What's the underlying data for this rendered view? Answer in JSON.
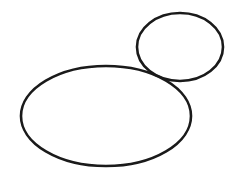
{
  "diagram": {
    "background": "#ffffff",
    "stroke_color": "#1a1a1a",
    "stroke_width": 2.6,
    "shapes": [
      {
        "name": "small-circle",
        "cx": 180,
        "cy": 47,
        "rx": 43,
        "ry": 34
      },
      {
        "name": "large-ellipse",
        "cx": 106,
        "cy": 116,
        "rx": 85,
        "ry": 50
      }
    ]
  }
}
